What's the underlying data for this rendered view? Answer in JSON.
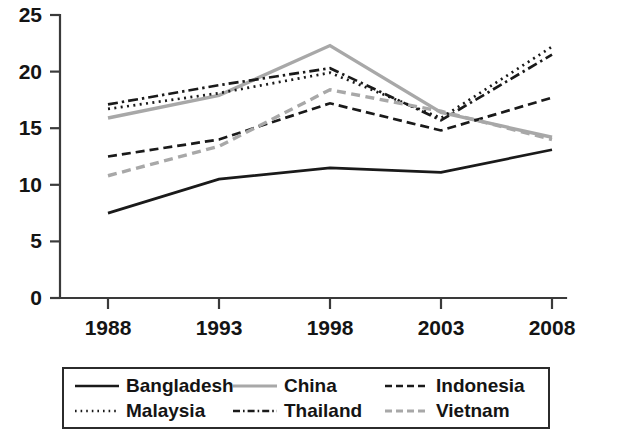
{
  "chart_data": {
    "type": "line",
    "title": "",
    "subtitle": "",
    "xlabel": "",
    "ylabel": "",
    "x": [
      1988,
      1993,
      1998,
      2003,
      2008
    ],
    "xtick_labels": [
      "1988",
      "1993",
      "1998",
      "2003",
      "2008"
    ],
    "ytick_labels": [
      "0",
      "5",
      "10",
      "15",
      "20",
      "25"
    ],
    "yticks": [
      0,
      5,
      10,
      15,
      20,
      25
    ],
    "xlim": [
      1988,
      2008
    ],
    "ylim": [
      0,
      25
    ],
    "grid": false,
    "legend_position": "bottom",
    "series": [
      {
        "name": "Bangladesh",
        "style": "solid",
        "color": "#1a1a1a",
        "values": [
          7.5,
          10.5,
          11.5,
          11.1,
          13.1
        ]
      },
      {
        "name": "China",
        "style": "solid",
        "color": "#a8a8a8",
        "values": [
          15.9,
          17.9,
          22.3,
          16.4,
          14.2
        ]
      },
      {
        "name": "Indonesia",
        "style": "dashed",
        "color": "#1a1a1a",
        "values": [
          12.5,
          14.0,
          17.2,
          14.8,
          17.7
        ]
      },
      {
        "name": "Malaysia",
        "style": "dotted",
        "color": "#1a1a1a",
        "values": [
          16.7,
          18.1,
          19.9,
          15.9,
          22.2
        ]
      },
      {
        "name": "Thailand",
        "style": "dashdot",
        "color": "#1a1a1a",
        "values": [
          17.1,
          18.8,
          20.3,
          15.7,
          21.5
        ]
      },
      {
        "name": "Vietnam",
        "style": "dashed",
        "color": "#a8a8a8",
        "values": [
          10.8,
          13.4,
          18.4,
          16.5,
          14.0
        ]
      }
    ]
  },
  "legend": {
    "items": [
      {
        "label": "Bangladesh",
        "swatch": "legend-swatch-bangladesh"
      },
      {
        "label": "China",
        "swatch": "legend-swatch-china"
      },
      {
        "label": "Indonesia",
        "swatch": "legend-swatch-indonesia"
      },
      {
        "label": "Malaysia",
        "swatch": "legend-swatch-malaysia"
      },
      {
        "label": "Thailand",
        "swatch": "legend-swatch-thailand"
      },
      {
        "label": "Vietnam",
        "swatch": "legend-swatch-vietnam"
      }
    ]
  }
}
